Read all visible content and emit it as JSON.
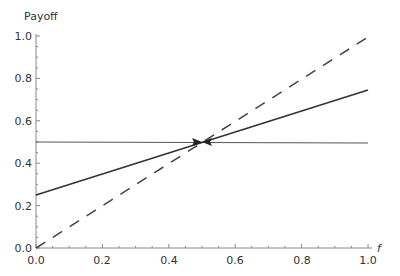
{
  "chart_data": {
    "type": "line",
    "title": "",
    "xlabel": "f",
    "ylabel": "Payoff",
    "xlim": [
      0,
      1
    ],
    "ylim": [
      0,
      1
    ],
    "grid": false,
    "x_ticks": [
      "0.0",
      "0.2",
      "0.4",
      "0.6",
      "0.8",
      "1.0"
    ],
    "y_ticks": [
      "0.0",
      "0.2",
      "0.4",
      "0.6",
      "0.8",
      "1.0"
    ],
    "series": [
      {
        "name": "constant",
        "style": "thin solid",
        "x": [
          0,
          1
        ],
        "y": [
          0.5,
          0.5
        ]
      },
      {
        "name": "solid",
        "style": "solid",
        "x": [
          0,
          1
        ],
        "y": [
          0.25,
          0.75
        ]
      },
      {
        "name": "dashed",
        "style": "dashed",
        "x": [
          0,
          1
        ],
        "y": [
          0,
          1
        ]
      }
    ],
    "annotations": [
      {
        "type": "arrows-converging",
        "x": 0.5,
        "y": 0.5
      }
    ]
  }
}
